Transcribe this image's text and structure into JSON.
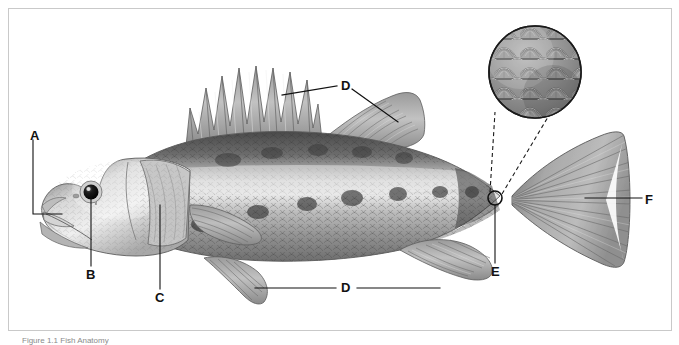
{
  "figure": {
    "caption": "Figure 1.1 Fish Anatomy",
    "background_color": "#ffffff",
    "frame_color": "#c9c9c9",
    "label_color": "#111111",
    "leader_color": "#1a1a1a"
  },
  "labels": [
    {
      "id": "A",
      "text": "A",
      "target": "mouth-jaw",
      "x": 30,
      "y": 129
    },
    {
      "id": "B",
      "text": "B",
      "target": "eye",
      "x": 88,
      "y": 276
    },
    {
      "id": "C",
      "text": "C",
      "target": "operculum-gill-cover",
      "x": 155,
      "y": 299
    },
    {
      "id": "D_top",
      "text": "D",
      "target": "dorsal-fins",
      "x": 344,
      "y": 83
    },
    {
      "id": "D_bottom",
      "text": "D",
      "target": "pelvic-and-anal-fins",
      "x": 343,
      "y": 292
    },
    {
      "id": "E",
      "text": "E",
      "target": "scales",
      "x": 492,
      "y": 272
    },
    {
      "id": "F",
      "text": "F",
      "target": "caudal-fin",
      "x": 646,
      "y": 200
    }
  ],
  "inset": {
    "name": "magnified-scales-inset",
    "center_x": 535,
    "center_y": 72,
    "radius": 47,
    "description": "Magnified circular view of overlapping cycloid scales"
  },
  "callout_marker": {
    "name": "scale-callout-circle",
    "x": 495,
    "y": 198,
    "radius": 7
  },
  "fish": {
    "name": "fish-illustration",
    "parts": [
      "head",
      "eye",
      "mouth",
      "operculum",
      "pectoral-fin",
      "spiny-dorsal-fin",
      "soft-dorsal-fin",
      "pelvic-fin",
      "anal-fin",
      "caudal-peduncle",
      "caudal-fin",
      "scaled-body"
    ]
  }
}
